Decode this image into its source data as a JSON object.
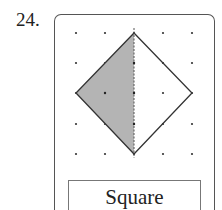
{
  "problem": {
    "number": "24.",
    "shape_label": "Square",
    "grid": {
      "cols": 5,
      "rows": 5
    },
    "shaded_half": "left",
    "shade_color": "#b4b4b4",
    "line_color": "#333333"
  }
}
